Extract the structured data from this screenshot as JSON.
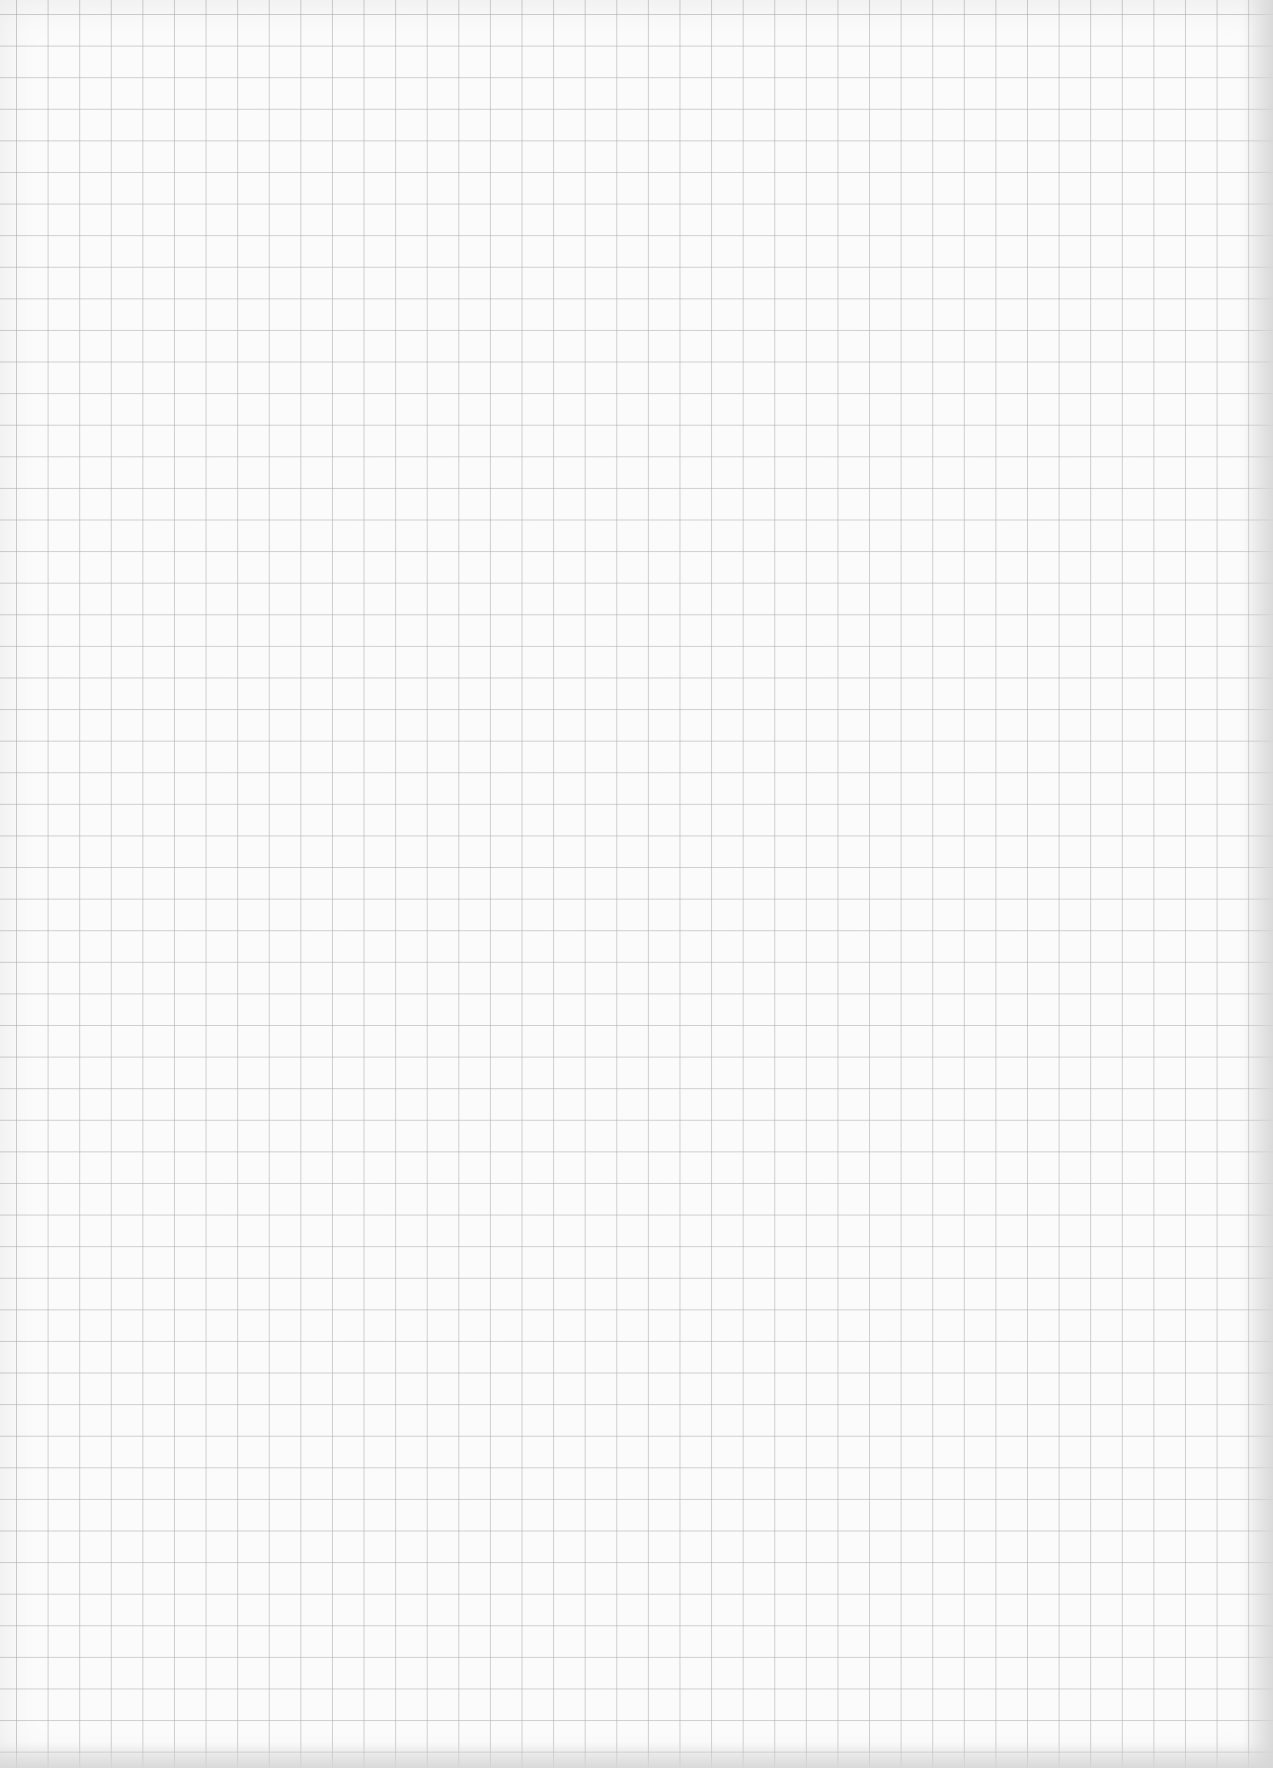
{
  "page": {
    "type": "grid-paper-scan",
    "content": "blank graph paper sheet",
    "grid_color": "#aaaaaa",
    "paper_color": "#fbfbfb"
  },
  "bleed_through": {
    "legible": false,
    "lines": [
      "",
      "",
      "",
      "",
      "",
      "",
      "",
      "",
      "",
      "",
      "",
      "",
      "",
      ""
    ]
  }
}
